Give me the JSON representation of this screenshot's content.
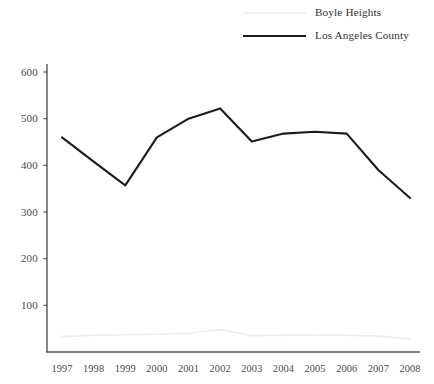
{
  "chart_data": {
    "type": "line",
    "title": "",
    "xlabel": "",
    "ylabel": "",
    "x": [
      1997,
      1998,
      1999,
      2000,
      2001,
      2002,
      2003,
      2004,
      2005,
      2006,
      2007,
      2008
    ],
    "xtick_labels": [
      "1997",
      "1998",
      "1999",
      "2000",
      "2001",
      "2002",
      "2003",
      "2004",
      "2005",
      "2006",
      "2007",
      "2008"
    ],
    "ytick_labels": [
      "100",
      "200",
      "300",
      "400",
      "500",
      "600"
    ],
    "yticks": [
      100,
      200,
      300,
      400,
      500,
      600
    ],
    "ylim": [
      0,
      600
    ],
    "grid": false,
    "legend_position": "top-right",
    "series": [
      {
        "name": "Boyle Heights",
        "color": "#ededed",
        "values": [
          33,
          36,
          37,
          38,
          40,
          48,
          35,
          36,
          37,
          36,
          34,
          28
        ]
      },
      {
        "name": "Los Angeles County",
        "color": "#1c1c1c",
        "values": [
          460,
          408,
          357,
          460,
          500,
          522,
          451,
          468,
          472,
          468,
          390,
          330
        ]
      }
    ]
  },
  "axis": {
    "line_color": "#54544f"
  }
}
